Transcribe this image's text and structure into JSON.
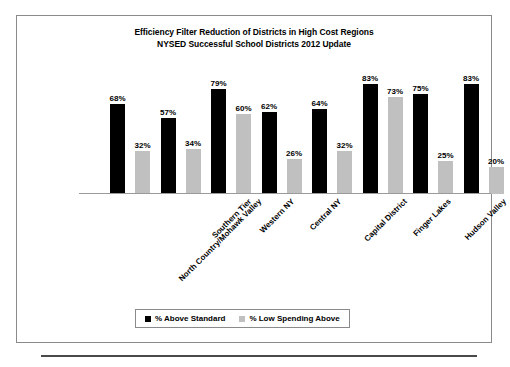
{
  "chart_data": {
    "type": "bar",
    "title": "Efficiency Filter Reduction of Districts in High Cost Regions NYSED Successful School Districts 2012 Update",
    "title_lines": [
      "Efficiency Filter Reduction of Districts in High Cost Regions",
      "NYSED Successful School Districts 2012 Update"
    ],
    "xlabel": "",
    "ylabel": "",
    "ylim": [
      0,
      100
    ],
    "grid": false,
    "legend_position": "bottom",
    "categories": [
      "North Country/Mohawk Valley",
      "Southern Tier",
      "Western NY",
      "Central NY",
      "Capital District",
      "Finger Lakes",
      "Hudson Valley",
      "Long Island/NYC"
    ],
    "series": [
      {
        "name": "% Above Standard",
        "color": "#000000",
        "values": [
          68,
          57,
          79,
          62,
          64,
          83,
          75,
          83
        ],
        "labels": [
          "68%",
          "57%",
          "79%",
          "62%",
          "64%",
          "83%",
          "75%",
          "83%"
        ]
      },
      {
        "name": "% Low Spending Above",
        "color": "#c0c0c0",
        "values": [
          32,
          34,
          60,
          26,
          32,
          73,
          25,
          20
        ],
        "labels": [
          "32%",
          "34%",
          "60%",
          "26%",
          "32%",
          "73%",
          "25%",
          "20%"
        ]
      }
    ]
  },
  "legend": {
    "items": [
      {
        "label": "% Above Standard",
        "color": "#000000"
      },
      {
        "label": "% Low Spending Above",
        "color": "#c0c0c0"
      }
    ]
  },
  "colors": {
    "series_above_standard": "#000000",
    "series_low_spending": "#c0c0c0",
    "frame_border": "#8a8a8a",
    "axis_line": "#9a9a9a",
    "bottom_rule": "#4a4a4a",
    "background": "#ffffff",
    "text": "#000000"
  }
}
